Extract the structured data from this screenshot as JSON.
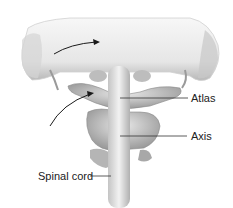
{
  "figure": {
    "labels": {
      "atlas": "Atlas",
      "axis": "Axis",
      "spinal_cord": "Spinal cord"
    },
    "colors": {
      "bone_light": "#eeeeee",
      "bone_mid": "#c8c8c8",
      "bone_dark": "#8a8a8a",
      "leader_line": "#333333",
      "arrow": "#1a1a1a"
    }
  }
}
